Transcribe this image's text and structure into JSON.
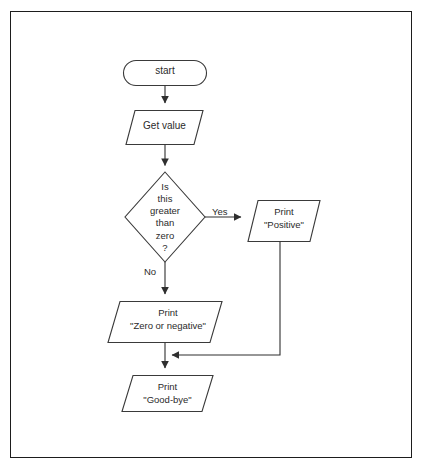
{
  "diagram": {
    "type": "flowchart",
    "stroke_color": "#3a3a3a",
    "text_color": "#2b2b2b",
    "border_color": "#1d1d1d",
    "background": "#ffffff",
    "nodes": [
      {
        "id": "start",
        "shape": "terminator",
        "text": "start"
      },
      {
        "id": "get_value",
        "shape": "parallelogram",
        "text": "Get value"
      },
      {
        "id": "condition",
        "shape": "diamond",
        "text": "Is\nthis\ngreater\nthan\nzero\n?"
      },
      {
        "id": "print_positive",
        "shape": "parallelogram",
        "text": "Print\n\"Positive\""
      },
      {
        "id": "print_zero_negative",
        "shape": "parallelogram",
        "text": "Print\n\"Zero or negative\""
      },
      {
        "id": "print_goodbye",
        "shape": "parallelogram",
        "text": "Print\n\"Good-bye\""
      }
    ],
    "edge_labels": {
      "yes": "Yes",
      "no": "No"
    }
  }
}
